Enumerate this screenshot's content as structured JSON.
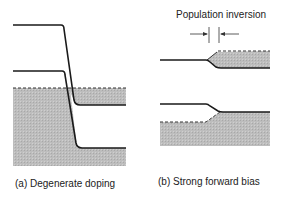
{
  "figure": {
    "panel_a": {
      "caption": "(a) Degenerate doping"
    },
    "panel_b": {
      "caption": "(b) Strong forward bias",
      "annotation": "Population inversion"
    },
    "colors": {
      "line": "#1a1a1a",
      "shade": "#b8b8b8",
      "background": "#ffffff"
    }
  }
}
